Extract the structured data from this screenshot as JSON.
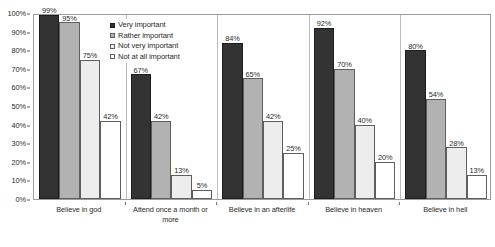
{
  "chart_data": {
    "type": "bar",
    "title": "",
    "subtitle": "",
    "xlabel": "",
    "ylabel": "",
    "ylim": [
      0,
      100
    ],
    "ytick_labels": [
      "100%",
      "90%",
      "80%",
      "70%",
      "60%",
      "50%",
      "40%",
      "30%",
      "20%",
      "10%",
      "0%"
    ],
    "ytick_values": [
      100,
      90,
      80,
      70,
      60,
      50,
      40,
      30,
      20,
      10,
      0
    ],
    "grid": false,
    "legend_position": "inside-top-left",
    "value_label_suffix": "%",
    "categories": [
      "Believe in god",
      "Attend once a month or more",
      "Believe in an afterlife",
      "Believe in heaven",
      "Believe in hell"
    ],
    "series": [
      {
        "name": "Very important",
        "color": "#333333",
        "values": [
          99,
          67,
          84,
          92,
          80
        ],
        "labels": [
          "99%",
          "67%",
          "84%",
          "92%",
          "80%"
        ]
      },
      {
        "name": "Rather important",
        "color": "#b2b2b2",
        "values": [
          95,
          42,
          65,
          70,
          54
        ],
        "labels": [
          "95%",
          "42%",
          "65%",
          "70%",
          "54%"
        ]
      },
      {
        "name": "Not very important",
        "color": "#ededed",
        "values": [
          75,
          13,
          42,
          40,
          28
        ],
        "labels": [
          "75%",
          "13%",
          "42%",
          "40%",
          "28%"
        ]
      },
      {
        "name": "Not at all important",
        "color": "#ffffff",
        "values": [
          42,
          5,
          25,
          20,
          13
        ],
        "labels": [
          "42%",
          "5%",
          "25%",
          "20%",
          "13%"
        ]
      }
    ]
  }
}
